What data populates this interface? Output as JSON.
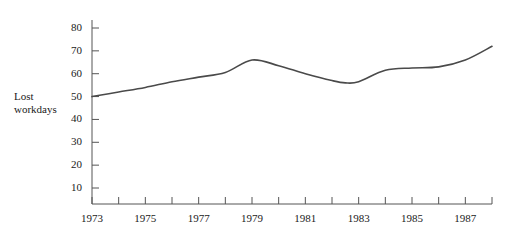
{
  "chart_data": {
    "type": "line",
    "title": "",
    "xlabel": "",
    "ylabel": "Lost workdays",
    "ylabel_line1": "Lost",
    "ylabel_line2": "workdays",
    "xlim": [
      1973,
      1988
    ],
    "ylim": [
      0,
      85
    ],
    "grid": false,
    "legend": "none",
    "line_color": "#4a4a4a",
    "axis_color": "#555555",
    "y_ticks": [
      10,
      20,
      30,
      40,
      50,
      60,
      70,
      80
    ],
    "y_tick_labels": [
      "10",
      "20",
      "30",
      "40",
      "50",
      "60",
      "70",
      "80"
    ],
    "x_ticks": [
      1973,
      1974,
      1975,
      1976,
      1977,
      1978,
      1979,
      1980,
      1981,
      1982,
      1983,
      1984,
      1985,
      1986,
      1987,
      1988
    ],
    "x_tick_labels": [
      "1973",
      "",
      "1975",
      "",
      "1977",
      "",
      "1979",
      "",
      "1981",
      "",
      "1983",
      "",
      "1985",
      "",
      "1987",
      ""
    ],
    "x_labeled_ticks": [
      {
        "year": 1973,
        "label": "1973"
      },
      {
        "year": 1975,
        "label": "1975"
      },
      {
        "year": 1977,
        "label": "1977"
      },
      {
        "year": 1979,
        "label": "1979"
      },
      {
        "year": 1981,
        "label": "1981"
      },
      {
        "year": 1983,
        "label": "1983"
      },
      {
        "year": 1985,
        "label": "1985"
      },
      {
        "year": 1987,
        "label": "1987"
      }
    ],
    "x": [
      1973,
      1974,
      1975,
      1976,
      1977,
      1978,
      1979,
      1980,
      1981,
      1982,
      1982.5,
      1983,
      1984,
      1985,
      1986,
      1987,
      1988
    ],
    "values": [
      50.0,
      52.0,
      54.0,
      56.5,
      58.5,
      60.5,
      66.0,
      63.5,
      60.0,
      57.0,
      56.0,
      56.5,
      61.5,
      62.5,
      63.0,
      66.0,
      72.0
    ],
    "series": [
      {
        "name": "Lost workdays",
        "values": [
          50.0,
          52.0,
          54.0,
          56.5,
          58.5,
          60.5,
          66.0,
          63.5,
          60.0,
          57.0,
          56.0,
          56.5,
          61.5,
          62.5,
          63.0,
          66.0,
          72.0
        ]
      }
    ],
    "annotations": []
  }
}
